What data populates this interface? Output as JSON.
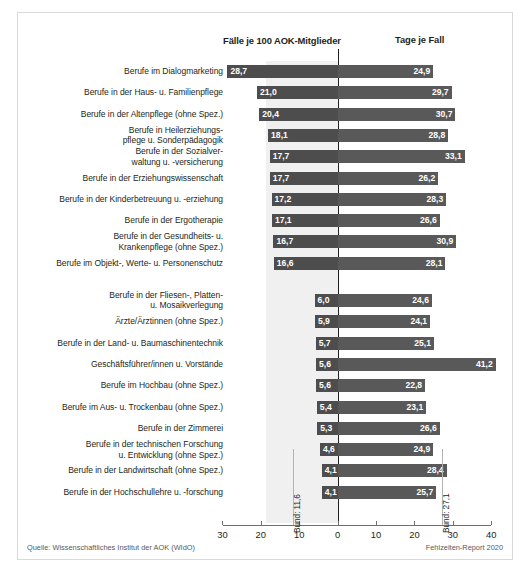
{
  "header": {
    "left_title": "Fälle je 100 AOK-Mitglieder",
    "right_title": "Tage je Fall"
  },
  "footer": {
    "source": "Quelle: Wissenschaftliches Institut der AOK (WIdO)",
    "report": "Fehlzeiten-Report 2020"
  },
  "annotations": {
    "bund_left": "Bund: 11,6",
    "bund_right": "Bund: 27,1"
  },
  "chart_data": {
    "type": "bar",
    "title": "",
    "subtitle": "",
    "orientation": "horizontal-diverging",
    "xlabel": "",
    "ylabel": "",
    "grid": false,
    "legend_position": "top",
    "axis": {
      "left_ticks": [
        30,
        20,
        10,
        0
      ],
      "right_ticks": [
        10,
        20,
        30,
        40
      ],
      "left_max": 30,
      "right_max": 40,
      "tick_labels": [
        "30",
        "20",
        "10",
        "0",
        "10",
        "20",
        "30",
        "40"
      ]
    },
    "series": [
      {
        "name": "Fälle je 100 AOK-Mitglieder",
        "side": "left",
        "color": "#4d4d4d"
      },
      {
        "name": "Tage je Fall",
        "side": "right",
        "color": "#595959"
      }
    ],
    "reference_lines": [
      {
        "label": "Bund: 11,6",
        "side": "left",
        "value": 11.6
      },
      {
        "label": "Bund: 27,1",
        "side": "right",
        "value": 27.1
      }
    ],
    "groups": [
      {
        "name": "top",
        "categories": [
          "Berufe im Dialogmarketing",
          "Berufe in der Haus- u. Familienpflege",
          "Berufe in der Altenpflege (ohne Spez.)",
          "Berufe in Heilerziehungs-\npflege u. Sonderpädagogik",
          "Berufe in der Sozialver-\nwaltung u. -versicherung",
          "Berufe in der Erziehungswissenschaft",
          "Berufe in der Kinderbetreuung u. -erziehung",
          "Berufe in der Ergotherapie",
          "Berufe in der Gesundheits- u.\nKrankenpflege (ohne Spez.)",
          "Berufe im Objekt-, Werte- u. Personenschutz"
        ],
        "faelle": [
          28.7,
          21.0,
          20.4,
          18.1,
          17.7,
          17.7,
          17.2,
          17.1,
          16.7,
          16.6
        ],
        "faelle_text": [
          "28,7",
          "21,0",
          "20,4",
          "18,1",
          "17,7",
          "17,7",
          "17,2",
          "17,1",
          "16,7",
          "16,6"
        ],
        "tage": [
          24.9,
          29.7,
          30.7,
          28.8,
          33.1,
          26.2,
          28.3,
          26.6,
          30.9,
          28.1
        ],
        "tage_text": [
          "24,9",
          "29,7",
          "30,7",
          "28,8",
          "33,1",
          "26,2",
          "28,3",
          "26,6",
          "30,9",
          "28,1"
        ]
      },
      {
        "name": "bottom",
        "categories": [
          "Berufe in der Fliesen-, Platten-\nu. Mosaikverlegung",
          "Ärzte/Ärztinnen (ohne Spez.)",
          "Berufe in der Land- u. Baumaschinentechnik",
          "Geschäftsführer/innen u. Vorstände",
          "Berufe im Hochbau (ohne Spez.)",
          "Berufe im Aus- u. Trockenbau (ohne Spez.)",
          "Berufe in der Zimmerei",
          "Berufe in der technischen Forschung\nu. Entwicklung (ohne Spez.)",
          "Berufe in der Landwirtschaft (ohne Spez.)",
          "Berufe in der Hochschullehre u. -forschung"
        ],
        "faelle": [
          6.0,
          5.9,
          5.7,
          5.6,
          5.6,
          5.4,
          5.3,
          4.6,
          4.1,
          4.1
        ],
        "faelle_text": [
          "6,0",
          "5,9",
          "5,7",
          "5,6",
          "5,6",
          "5,4",
          "5,3",
          "4,6",
          "4,1",
          "4,1"
        ],
        "tage": [
          24.6,
          24.1,
          25.1,
          41.2,
          22.8,
          23.1,
          26.6,
          24.9,
          28.4,
          25.7
        ],
        "tage_text": [
          "24,6",
          "24,1",
          "25,1",
          "41,2",
          "22,8",
          "23,1",
          "26,6",
          "24,9",
          "28,4",
          "25,7"
        ]
      }
    ]
  }
}
